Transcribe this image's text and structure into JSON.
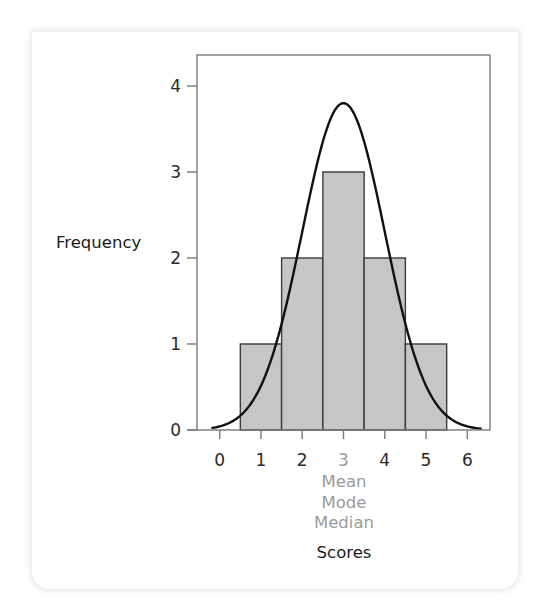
{
  "chart_data": {
    "type": "bar",
    "subtype": "histogram_with_normal_curve",
    "title": "",
    "xlabel": "Scores",
    "ylabel": "Frequency",
    "x_ticks": [
      "0",
      "1",
      "2",
      "3",
      "4",
      "5",
      "6"
    ],
    "y_ticks": [
      "0",
      "1",
      "2",
      "3",
      "4"
    ],
    "xlim": [
      -0.55,
      6.55
    ],
    "ylim": [
      0,
      4.36
    ],
    "grid": false,
    "highlighted_tick": "3",
    "annotation_lines": [
      "Mean",
      "Mode",
      "Median"
    ],
    "categories": [
      "1",
      "2",
      "3",
      "4",
      "5"
    ],
    "values": [
      1,
      2,
      3,
      2,
      1
    ],
    "bars": [
      {
        "x": 1,
        "frequency": 1
      },
      {
        "x": 2,
        "frequency": 2
      },
      {
        "x": 3,
        "frequency": 3
      },
      {
        "x": 4,
        "frequency": 2
      },
      {
        "x": 5,
        "frequency": 1
      }
    ],
    "curve": {
      "type": "normal",
      "mean": 3,
      "sd": 1,
      "peak": 3.8
    },
    "colors": {
      "bar_fill": "#c6c6c6",
      "bar_stroke": "#3a3a3a",
      "curve": "#111111",
      "frame": "#7a7a7a",
      "highlight_text": "#9a9a9a"
    }
  }
}
